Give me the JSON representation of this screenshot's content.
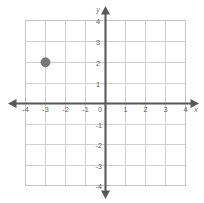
{
  "chart_data": {
    "type": "scatter",
    "title": "",
    "xlabel": "x",
    "ylabel": "y",
    "xlim": [
      -4,
      4
    ],
    "ylim": [
      -4,
      4
    ],
    "grid": true,
    "legend": false,
    "x_ticks": [
      -4,
      -3,
      -2,
      -1,
      0,
      1,
      2,
      3,
      4
    ],
    "y_ticks": [
      -4,
      -3,
      -2,
      -1,
      1,
      2,
      3,
      4
    ],
    "x_tick_labels": [
      "-4",
      "-3",
      "-2",
      "-1",
      "0",
      "1",
      "2",
      "3",
      "4"
    ],
    "y_tick_labels": [
      "-4",
      "-3",
      "-2",
      "-1",
      "1",
      "2",
      "3",
      "4"
    ],
    "origin_label": "0",
    "series": [
      {
        "name": "plotted-point",
        "marker": "circle",
        "color": "#777779",
        "points": [
          {
            "x": -3,
            "y": 2,
            "label": "(-3, 2)"
          }
        ]
      }
    ]
  },
  "axes": {
    "x_axis_name": "x",
    "y_axis_name": "y",
    "axis_color": "#58585a",
    "grid_color": "#cccccc",
    "background_color": "#ffffff"
  }
}
